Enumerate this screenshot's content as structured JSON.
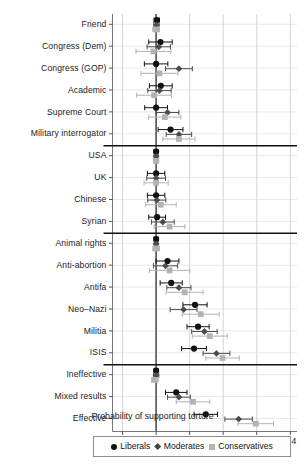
{
  "chart_data": {
    "type": "scatter",
    "title": "",
    "xlabel": "Probability of supporting torture",
    "ylabel": "",
    "xlim": [
      -0.13,
      0.42
    ],
    "xticks": [
      -0.1,
      0,
      0.1,
      0.2,
      0.3,
      0.4
    ],
    "xticklabels": [
      "–0.1",
      "0",
      "0.1",
      "0.2",
      "0.3",
      "0.4"
    ],
    "grid": true,
    "grid_axis": "x",
    "zero_reference_line": 0,
    "orientation": "horizontal",
    "error_bars": "confidence interval",
    "legend_position": "bottom",
    "group_separators_after": [
      "Military interrogator",
      "Syrian",
      "ISIS"
    ],
    "categories": [
      "Friend",
      "Congress (Dem)",
      "Congress (GOP)",
      "Academic",
      "Supreme Court",
      "Military interrogator",
      "USA",
      "UK",
      "Chinese",
      "Syrian",
      "Animal rights",
      "Anti-abortion",
      "Antifa",
      "Neo–Nazi",
      "Militia",
      "ISIS",
      "Ineffective",
      "Mixed results",
      "Effective"
    ],
    "series": [
      {
        "name": "Liberals",
        "marker": "circle",
        "color": "#111111",
        "values": [
          0.002,
          0.013,
          0.0,
          0.014,
          0.0,
          0.043,
          0.0,
          0.0,
          0.0,
          0.003,
          0.0,
          0.034,
          0.045,
          0.116,
          0.125,
          0.113,
          0.0,
          0.06,
          0.148
        ],
        "ci_lower": [
          -0.006,
          -0.022,
          -0.035,
          -0.02,
          -0.034,
          0.006,
          -0.006,
          -0.026,
          -0.026,
          -0.022,
          -0.006,
          0.0,
          0.012,
          0.08,
          0.092,
          0.076,
          -0.006,
          0.028,
          0.113
        ],
        "ci_upper": [
          0.01,
          0.048,
          0.035,
          0.048,
          0.034,
          0.08,
          0.006,
          0.026,
          0.026,
          0.028,
          0.006,
          0.068,
          0.078,
          0.152,
          0.158,
          0.15,
          0.006,
          0.092,
          0.183
        ]
      },
      {
        "name": "Moderates",
        "marker": "diamond",
        "color": "#4d4d4d",
        "values": [
          0.001,
          0.008,
          0.068,
          0.01,
          0.034,
          0.068,
          0.0,
          0.0,
          0.002,
          0.02,
          0.0,
          0.028,
          0.068,
          0.082,
          0.144,
          0.18,
          0.0,
          0.068,
          0.246
        ],
        "ci_lower": [
          -0.007,
          -0.027,
          0.028,
          -0.025,
          0.0,
          0.03,
          -0.006,
          -0.028,
          -0.025,
          -0.014,
          -0.006,
          -0.008,
          0.032,
          0.042,
          0.106,
          0.14,
          -0.008,
          0.034,
          0.205
        ],
        "ci_upper": [
          0.009,
          0.043,
          0.108,
          0.045,
          0.068,
          0.106,
          0.006,
          0.028,
          0.029,
          0.054,
          0.006,
          0.064,
          0.104,
          0.122,
          0.182,
          0.22,
          0.008,
          0.102,
          0.287
        ]
      },
      {
        "name": "Conservatives",
        "marker": "square",
        "color": "#b3b3b3",
        "values": [
          0.0,
          -0.008,
          0.01,
          -0.006,
          0.026,
          0.068,
          0.0,
          0.0,
          0.014,
          0.04,
          0.0,
          0.04,
          0.085,
          0.133,
          0.16,
          0.198,
          -0.004,
          0.11,
          0.297
        ],
        "ci_lower": [
          -0.01,
          -0.06,
          -0.045,
          -0.058,
          -0.022,
          0.02,
          -0.008,
          -0.036,
          -0.032,
          -0.006,
          -0.01,
          -0.02,
          0.03,
          0.078,
          0.108,
          0.148,
          -0.014,
          0.06,
          0.244
        ],
        "ci_upper": [
          0.01,
          0.044,
          0.065,
          0.046,
          0.074,
          0.116,
          0.008,
          0.036,
          0.06,
          0.086,
          0.01,
          0.1,
          0.14,
          0.188,
          0.212,
          0.248,
          0.006,
          0.16,
          0.35
        ]
      }
    ],
    "legend": [
      {
        "label": "Liberals",
        "marker": "circle",
        "color": "#111111"
      },
      {
        "label": "Moderates",
        "marker": "diamond",
        "color": "#4d4d4d"
      },
      {
        "label": "Conservatives",
        "marker": "square",
        "color": "#b3b3b3"
      }
    ]
  }
}
